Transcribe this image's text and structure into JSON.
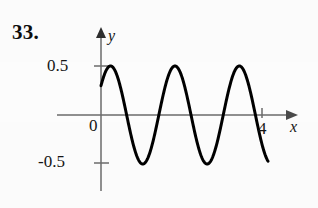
{
  "figure": {
    "problem_number": "33.",
    "axis_x_name": "x",
    "axis_y_name": "y",
    "origin_label": "0",
    "y_tick_upper_label": "0.5",
    "y_tick_lower_label": "-0.5",
    "x_tick_label": "4",
    "curve_color": "#000000",
    "axis_color": "#6b6b6b",
    "background_color": "#fdfdfd"
  },
  "chart_data": {
    "type": "line",
    "title": "",
    "xlabel": "x",
    "ylabel": "y",
    "xlim": [
      0,
      4.3
    ],
    "ylim": [
      -0.72,
      0.62
    ],
    "grid": false,
    "legend": "none",
    "x_ticks": [
      0,
      4
    ],
    "x_tick_labels": [
      "0",
      "4"
    ],
    "y_ticks": [
      -0.5,
      0,
      0.5
    ],
    "y_tick_labels": [
      "-0.5",
      "0",
      "0.5"
    ],
    "annotations": [
      "33."
    ],
    "series": [
      {
        "name": "y = 0.5 sin(2πx/1.6 + 0.64)",
        "amplitude": 0.5,
        "period": 1.6,
        "phase_rad": 0.64,
        "x_start": 0.0,
        "x_end": 4.15,
        "x": [
          0.0,
          0.05,
          0.1,
          0.15,
          0.2,
          0.25,
          0.3,
          0.35,
          0.4,
          0.45,
          0.5,
          0.55,
          0.6,
          0.65,
          0.7,
          0.75,
          0.8,
          0.85,
          0.9,
          0.95,
          1.0,
          1.05,
          1.1,
          1.15,
          1.2,
          1.25,
          1.3,
          1.35,
          1.4,
          1.45,
          1.5,
          1.55,
          1.6,
          1.65,
          1.7,
          1.75,
          1.8,
          1.85,
          1.9,
          1.95,
          2.0,
          2.05,
          2.1,
          2.15,
          2.2,
          2.25,
          2.3,
          2.35,
          2.4,
          2.45,
          2.5,
          2.55,
          2.6,
          2.65,
          2.7,
          2.75,
          2.8,
          2.85,
          2.9,
          2.95,
          3.0,
          3.05,
          3.1,
          3.15,
          3.2,
          3.25,
          3.3,
          3.35,
          3.4,
          3.45,
          3.5,
          3.55,
          3.6,
          3.65,
          3.7,
          3.75,
          3.8,
          3.85,
          3.9,
          3.95,
          4.0,
          4.05,
          4.1,
          4.15
        ],
        "y": [
          0.299,
          0.356,
          0.406,
          0.447,
          0.478,
          0.496,
          0.5,
          0.492,
          0.47,
          0.436,
          0.391,
          0.336,
          0.273,
          0.204,
          0.13,
          0.053,
          -0.026,
          -0.103,
          -0.178,
          -0.248,
          -0.311,
          -0.366,
          -0.412,
          -0.451,
          -0.48,
          -0.497,
          -0.5,
          -0.49,
          -0.467,
          -0.432,
          -0.386,
          -0.33,
          -0.265,
          -0.195,
          -0.121,
          -0.044,
          0.035,
          0.112,
          0.186,
          0.256,
          0.318,
          0.373,
          0.419,
          0.455,
          0.482,
          0.497,
          0.5,
          0.489,
          0.465,
          0.428,
          0.381,
          0.324,
          0.258,
          0.187,
          0.112,
          0.035,
          -0.044,
          -0.121,
          -0.195,
          -0.265,
          -0.33,
          -0.386,
          -0.432,
          -0.467,
          -0.49,
          -0.5,
          -0.497,
          -0.48,
          -0.451,
          -0.412,
          -0.366,
          -0.311,
          -0.248,
          -0.178,
          -0.103,
          -0.026,
          0.053,
          0.13,
          0.204,
          0.273,
          0.336,
          0.391,
          0.436,
          0.47
        ],
        "peaks_x": [
          0.3,
          1.9,
          3.5
        ],
        "peaks_y": [
          0.5,
          0.5,
          0.5
        ],
        "troughs_x": [
          1.1,
          2.7,
          4.3
        ],
        "troughs_y": [
          -0.5,
          -0.5,
          -0.5
        ]
      }
    ]
  }
}
